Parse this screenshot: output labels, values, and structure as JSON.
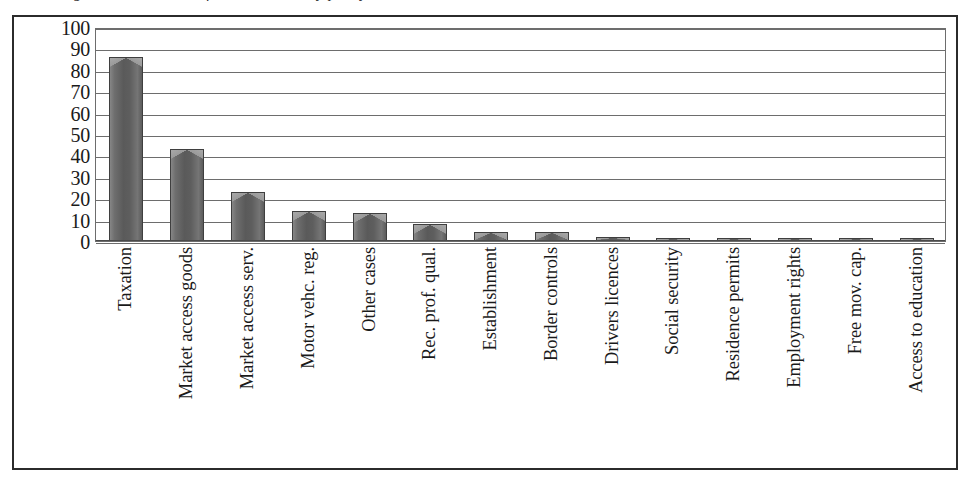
{
  "figure": {
    "caption_clipped": "Figure 3. Breakdown of SOLVIT cases by policy area, 2013"
  },
  "chart_data": {
    "type": "bar",
    "title": "",
    "xlabel": "",
    "ylabel": "",
    "ylim": [
      0,
      100
    ],
    "ytick_step": 10,
    "yticks": [
      "100",
      "90",
      "80",
      "70",
      "60",
      "50",
      "40",
      "30",
      "20",
      "10",
      "0"
    ],
    "grid": true,
    "legend": "none",
    "bar_color": "#5f5f5f",
    "bar_edge_color": "#3f3f3f",
    "bar_highlight_color": "#a3a3a3",
    "gridline_color": "#6d6d6d",
    "frame_color": "#2b2b2b",
    "categories": [
      "Taxation",
      "Market access goods",
      "Market access serv.",
      "Motor vehc. reg.",
      "Other cases",
      "Rec. prof. qual.",
      "Establishment",
      "Border controls",
      "Drivers licences",
      "Social security",
      "Residence permits",
      "Employment rights",
      "Free mov. cap.",
      "Access to education"
    ],
    "values": [
      86,
      43,
      23,
      14,
      13,
      8,
      4,
      4,
      2,
      1.5,
      0.6,
      0.6,
      0.6,
      0.6
    ]
  }
}
